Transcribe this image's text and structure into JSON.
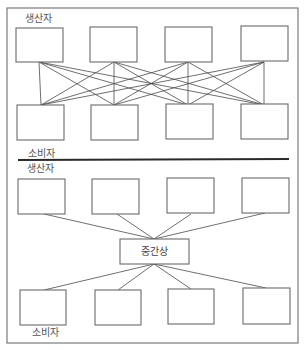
{
  "diagram": {
    "title": "",
    "top_section": {
      "producer_label": "생산자",
      "consumer_label": "소비자",
      "producers": [
        "",
        "",
        "",
        ""
      ],
      "consumers": [
        "",
        "",
        "",
        ""
      ],
      "connection_type": "direct (every producer to every consumer)"
    },
    "bottom_section": {
      "producer_label": "생산자",
      "consumer_label": "소비자",
      "intermediary_label": "중간상",
      "producers": [
        "",
        "",
        "",
        ""
      ],
      "consumers": [
        "",
        "",
        "",
        ""
      ],
      "connection_type": "via intermediary"
    },
    "colors": {
      "frame": "#7a7a7a",
      "box_stroke": "#6a6a6a",
      "edge": "#4a4a4a",
      "divider": "#2a2a2a",
      "label": "#555555"
    }
  }
}
